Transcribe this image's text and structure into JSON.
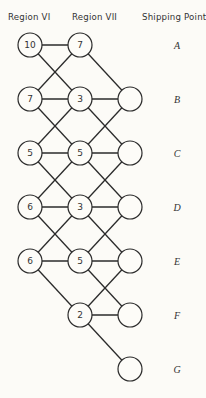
{
  "headers": {
    "region_vi": "Region VI",
    "region_vii": "Region VII",
    "shipping_point": "Shipping Point"
  },
  "rows": [
    "A",
    "B",
    "C",
    "D",
    "E",
    "F",
    "G"
  ],
  "region_vi_nodes": [
    {
      "row": "A",
      "value": "10"
    },
    {
      "row": "B",
      "value": "7"
    },
    {
      "row": "C",
      "value": "5"
    },
    {
      "row": "D",
      "value": "6"
    },
    {
      "row": "E",
      "value": "6"
    }
  ],
  "region_vii_nodes": [
    {
      "row": "A",
      "value": "7"
    },
    {
      "row": "B",
      "value": "3"
    },
    {
      "row": "C",
      "value": "5"
    },
    {
      "row": "D",
      "value": "3"
    },
    {
      "row": "E",
      "value": "5"
    },
    {
      "row": "F",
      "value": "2"
    }
  ],
  "shipping_nodes": [
    {
      "row": "B",
      "value": ""
    },
    {
      "row": "C",
      "value": ""
    },
    {
      "row": "D",
      "value": ""
    },
    {
      "row": "E",
      "value": ""
    },
    {
      "row": "F",
      "value": ""
    },
    {
      "row": "G",
      "value": ""
    }
  ],
  "colors": {
    "line": "#2b2b2b",
    "background": "#fcfbf7",
    "node_fill": "#fdfcf8"
  }
}
